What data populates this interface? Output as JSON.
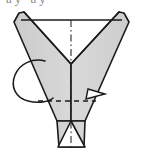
{
  "figure": {
    "kind": "origami-fold-diagram",
    "canvas": {
      "width": 143,
      "height": 157,
      "background": "#ffffff"
    },
    "clipped_header_text": "ay ay",
    "colors": {
      "paper_fill": "#d0d0d0",
      "paper_fill_light": "#dcdcdc",
      "outline": "#1a1a1a",
      "construction_line": "#2b2b2b",
      "background": "#ffffff"
    },
    "shapes": {
      "left_wing": {
        "name": "left-wing-panel",
        "points": "14,22 19,13 24,12 71,64 71,121 57,121"
      },
      "right_wing": {
        "name": "right-wing-panel",
        "points": "129,22 124,13 119,12 71,64 71,121 85,121"
      },
      "bottom_band": {
        "name": "bottom-edge-band",
        "points": "57,121 85,121 84,147 59,147"
      },
      "bottom_notch": {
        "name": "bottom-triangle-notch",
        "points": "71,121 84,147 59,147"
      }
    },
    "lines": {
      "top_edge": {
        "name": "top-horizontal-edge",
        "x1": 21,
        "y1": 20,
        "x2": 122,
        "y2": 20
      },
      "center_axis": {
        "name": "center-dash-dot-axis",
        "x1": 71,
        "y1": 20,
        "x2": 71,
        "y2": 147
      },
      "fold_line": {
        "name": "horizontal-fold-dashed-line",
        "x1": 38,
        "y1": 101,
        "x2": 93,
        "y2": 101
      }
    },
    "annotations": {
      "rotation_loop": {
        "name": "rotation-loop-arrow",
        "cx": 30,
        "cy": 80,
        "rx": 18,
        "ry": 23,
        "rotation": -20
      },
      "fold_arrow": {
        "name": "fold-direction-arrowhead",
        "tip_x": 103,
        "tip_y": 95,
        "label": "fold-right"
      }
    }
  }
}
